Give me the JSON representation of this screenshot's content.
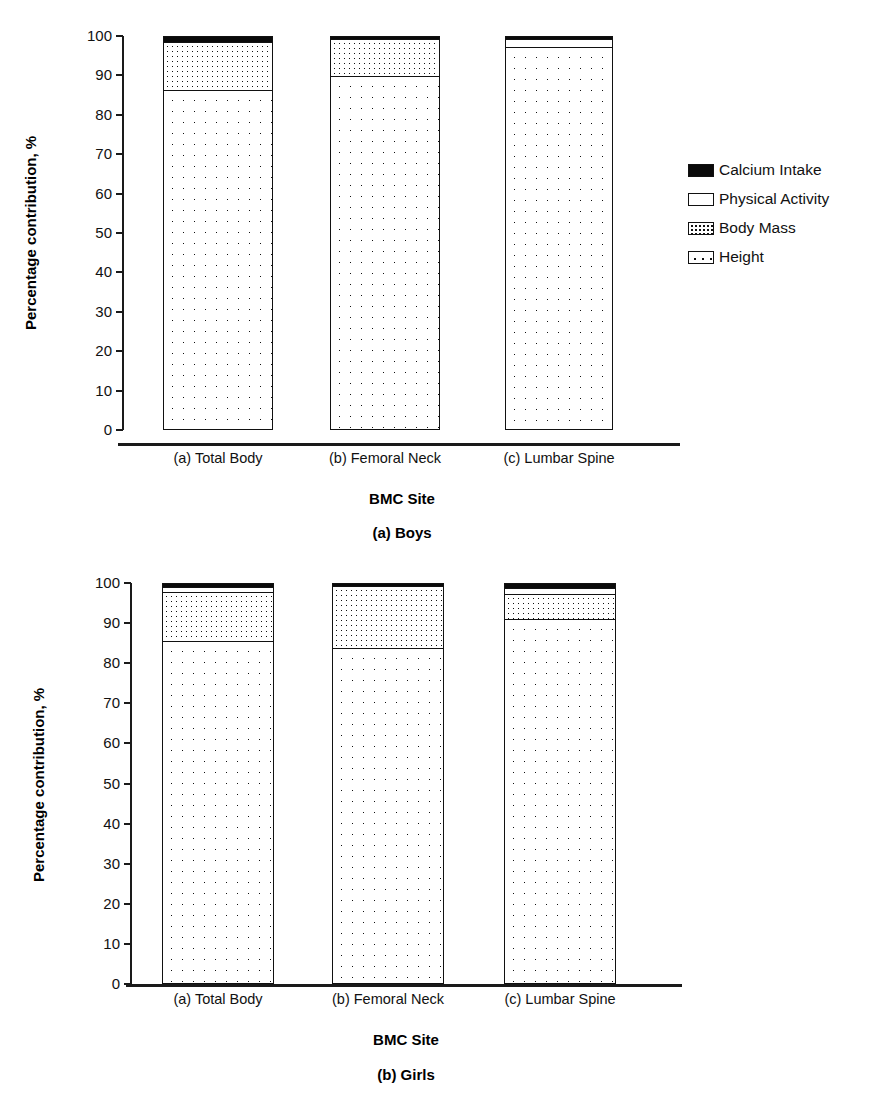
{
  "chart_data": [
    {
      "type": "bar",
      "title": "(a) Boys",
      "subtitle": "",
      "xlabel": "BMC Site",
      "ylabel": "Percentage contribution, %",
      "ylim": [
        0,
        100
      ],
      "yticks": [
        0,
        10,
        20,
        30,
        40,
        50,
        60,
        70,
        80,
        90,
        100
      ],
      "ytick_labels": [
        "0",
        "10",
        "20",
        "30",
        "40",
        "50",
        "60",
        "70",
        "80",
        "90",
        "100"
      ],
      "grid": false,
      "stacked": true,
      "legend_position": "right",
      "categories": [
        "(a) Total Body",
        "(b) Femoral Neck",
        "(c) Lumbar Spine"
      ],
      "series": [
        {
          "name": "Height",
          "values": [
            86.5,
            89.5,
            97.5
          ]
        },
        {
          "name": "Body Mass",
          "values": [
            12.3,
            9.5,
            0.0
          ]
        },
        {
          "name": "Physical Activity",
          "values": [
            0.0,
            0.0,
            2.0
          ]
        },
        {
          "name": "Calcium Intake",
          "values": [
            1.2,
            0.5,
            0.5
          ]
        }
      ]
    },
    {
      "type": "bar",
      "title": "(b) Girls",
      "subtitle": "",
      "xlabel": "BMC Site",
      "ylabel": "Percentage contribution, %",
      "ylim": [
        0,
        100
      ],
      "yticks": [
        0,
        10,
        20,
        30,
        40,
        50,
        60,
        70,
        80,
        90,
        100
      ],
      "ytick_labels": [
        "0",
        "10",
        "20",
        "30",
        "40",
        "50",
        "60",
        "70",
        "80",
        "90",
        "100"
      ],
      "grid": false,
      "stacked": true,
      "legend_position": "right",
      "categories": [
        "(a) Total Body",
        "(b) Femoral Neck",
        "(c) Lumbar Spine"
      ],
      "series": [
        {
          "name": "Height",
          "values": [
            85.8,
            84.0,
            91.3
          ]
        },
        {
          "name": "Body Mass",
          "values": [
            12.2,
            15.5,
            6.2
          ]
        },
        {
          "name": "Physical Activity",
          "values": [
            1.3,
            0.0,
            1.5
          ]
        },
        {
          "name": "Calcium Intake",
          "values": [
            0.7,
            0.5,
            1.0
          ]
        }
      ]
    }
  ],
  "panels": [
    {
      "id": "boys",
      "caption": "(a) Boys",
      "y_axis_title": "Percentage contribution, %",
      "x_axis_title": "BMC Site",
      "y_tick_labels": [
        "100",
        "90",
        "80",
        "70",
        "60",
        "50",
        "40",
        "30",
        "20",
        "10",
        "0"
      ],
      "x_tick_labels": [
        "(a) Total Body",
        "(b) Femoral Neck",
        "(c) Lumbar Spine"
      ],
      "legend": {
        "items": [
          {
            "label": "Calcium Intake",
            "swatch": "calcium",
            "color": "#0a0a0a"
          },
          {
            "label": "Physical Activity",
            "swatch": "physical",
            "color": "#ffffff"
          },
          {
            "label": "Body Mass",
            "swatch": "bodymass",
            "color": "#ffffff"
          },
          {
            "label": "Height",
            "swatch": "height",
            "color": "#ffffff"
          }
        ]
      }
    },
    {
      "id": "girls",
      "caption": "(b) Girls",
      "y_axis_title": "Percentage contribution, %",
      "x_axis_title": "BMC Site",
      "y_tick_labels": [
        "100",
        "90",
        "80",
        "70",
        "60",
        "50",
        "40",
        "30",
        "20",
        "10",
        "0"
      ],
      "x_tick_labels": [
        "(a) Total Body",
        "(b) Femoral Neck",
        "(c) Lumbar Spine"
      ],
      "legend": {
        "items": [
          {
            "label": "Calcium Intake",
            "swatch": "calcium",
            "color": "#0a0a0a"
          },
          {
            "label": "Physical Activity",
            "swatch": "physical",
            "color": "#ffffff"
          },
          {
            "label": "Body Mass",
            "swatch": "bodymass",
            "color": "#ffffff"
          },
          {
            "label": "Height",
            "swatch": "height",
            "color": "#ffffff"
          }
        ]
      }
    }
  ],
  "colors": {
    "axis": "#1a1a1a",
    "text": "#111111",
    "calcium_intake": "#0a0a0a",
    "physical_activity": "#ffffff",
    "body_mass": "#ffffff",
    "height": "#ffffff",
    "background": "#ffffff"
  }
}
